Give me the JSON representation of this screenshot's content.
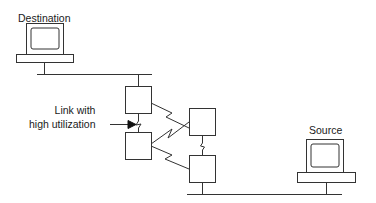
{
  "diagram": {
    "type": "network-topology",
    "colors": {
      "stroke": "#333333",
      "background": "#ffffff",
      "text": "#1a1a1a"
    },
    "labels": {
      "destination": "Destination",
      "source": "Source",
      "link_annotation_line1": "Link with",
      "link_annotation_line2": "high utilization"
    },
    "nodes": [
      {
        "id": "destination-host",
        "kind": "computer",
        "label": "Destination"
      },
      {
        "id": "router-1",
        "kind": "router"
      },
      {
        "id": "router-2",
        "kind": "router"
      },
      {
        "id": "router-3",
        "kind": "router"
      },
      {
        "id": "router-4",
        "kind": "router"
      },
      {
        "id": "source-host",
        "kind": "computer",
        "label": "Source"
      }
    ],
    "links": [
      {
        "from": "destination-host",
        "to": "router-1",
        "medium": "lan"
      },
      {
        "from": "router-1",
        "to": "router-2",
        "medium": "serial",
        "note": "Link with high utilization"
      },
      {
        "from": "router-1",
        "to": "router-3",
        "medium": "serial"
      },
      {
        "from": "router-2",
        "to": "router-3",
        "medium": "serial"
      },
      {
        "from": "router-2",
        "to": "router-4",
        "medium": "serial"
      },
      {
        "from": "router-3",
        "to": "router-4",
        "medium": "serial"
      },
      {
        "from": "router-4",
        "to": "source-host",
        "medium": "lan"
      }
    ]
  }
}
